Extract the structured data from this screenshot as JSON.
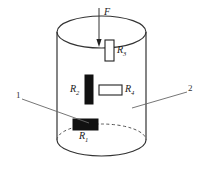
{
  "figure": {
    "type": "technical-diagram",
    "background_color": "#ffffff",
    "line_color": "#333333",
    "fill_dark_color": "#111111",
    "fill_light_color": "#ffffff"
  },
  "force": {
    "label": "F",
    "arrow_direction": "down",
    "arrow_x": 99,
    "arrow_y_start": 8,
    "arrow_y_end": 46
  },
  "cylinder": {
    "left_x": 57,
    "right_x": 146,
    "top_center_y": 32,
    "bottom_center_y": 140,
    "ellipse_rx": 44.5,
    "ellipse_ry": 16,
    "top_ellipse_visible": "solid",
    "bottom_front_arc": "solid",
    "bottom_back_arc": "dashed"
  },
  "gauges": [
    {
      "id": "R1",
      "label": "R",
      "subscript": "1",
      "orientation": "horizontal",
      "fill": "dark",
      "x": 73,
      "y": 119,
      "width": 25,
      "height": 11,
      "label_x": 80,
      "label_y": 131
    },
    {
      "id": "R2",
      "label": "R",
      "subscript": "2",
      "orientation": "vertical",
      "fill": "dark",
      "x": 85,
      "y": 75,
      "width": 8,
      "height": 29,
      "label_x": 71,
      "label_y": 85
    },
    {
      "id": "R3",
      "label": "R",
      "subscript": "3",
      "orientation": "vertical",
      "fill": "light",
      "x": 105,
      "y": 40,
      "width": 9,
      "height": 21,
      "label_x": 117,
      "label_y": 45
    },
    {
      "id": "R4",
      "label": "R",
      "subscript": "4",
      "orientation": "horizontal",
      "fill": "light",
      "x": 99,
      "y": 85,
      "width": 23,
      "height": 10,
      "label_x": 125,
      "label_y": 85
    }
  ],
  "callouts": [
    {
      "id": "1",
      "label": "1",
      "label_x": 16,
      "label_y": 92,
      "leader_x1": 22,
      "leader_y1": 99,
      "leader_x2": 89,
      "leader_y2": 123
    },
    {
      "id": "2",
      "label": "2",
      "label_x": 189,
      "label_y": 85,
      "leader_x1": 187,
      "leader_y1": 92,
      "leader_x2": 132,
      "leader_y2": 108
    }
  ]
}
